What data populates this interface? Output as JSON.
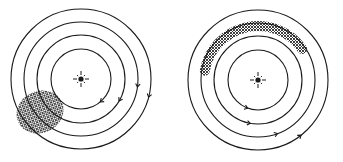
{
  "figure": {
    "background": "#ffffff",
    "ink": "#1a1a1a",
    "hatch_color": "#2a2a2a",
    "panels": [
      {
        "id": "left",
        "center": [
          81,
          79
        ],
        "radii": [
          70,
          57,
          44,
          30
        ],
        "star_icon": "sun-star-icon",
        "cloud": {
          "shape": "ellipse",
          "cx": 40,
          "cy": 112,
          "rx": 24,
          "ry": 21,
          "rotate": -25
        },
        "arrows": [
          {
            "r": 70,
            "angle": 15
          },
          {
            "r": 57,
            "angle": 8
          },
          {
            "r": 44,
            "angle": 30
          },
          {
            "r": 30,
            "angle": 50
          }
        ]
      },
      {
        "id": "right",
        "center": [
          258,
          80
        ],
        "radii": [
          70,
          57,
          44,
          30
        ],
        "star_icon": "sun-star-icon",
        "cloud": {
          "shape": "arc-band",
          "r": 54,
          "start": 190,
          "end": 325,
          "width": 10
        },
        "arrows": [
          {
            "r": 70,
            "angle": 52
          },
          {
            "r": 57,
            "angle": 70
          },
          {
            "r": 44,
            "angle": 100
          },
          {
            "r": 30,
            "angle": 110
          }
        ]
      }
    ]
  }
}
